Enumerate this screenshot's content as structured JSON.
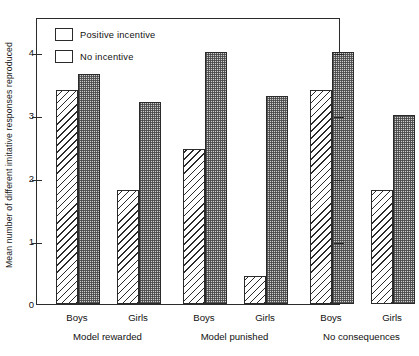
{
  "chart_data": {
    "type": "bar",
    "title": "",
    "xlabel": "",
    "ylabel": "Mean number of different imitative responses reproduced",
    "ylim": [
      0,
      4.55
    ],
    "yticks": [
      "0",
      "1",
      "2",
      "3",
      "4"
    ],
    "ytick_values": [
      0,
      1,
      2,
      3,
      4
    ],
    "grid": false,
    "legend_position": "top-left",
    "categories": [
      "Boys",
      "Girls",
      "Boys",
      "Girls",
      "Boys",
      "Girls"
    ],
    "groups": [
      {
        "group_label": "Model rewarded",
        "bars": [
          {
            "sex": "Boys",
            "no_incentive": 3.4,
            "positive_incentive": 3.65
          },
          {
            "sex": "Girls",
            "no_incentive": 1.8,
            "positive_incentive": 3.2
          }
        ]
      },
      {
        "group_label": "Model punished",
        "bars": [
          {
            "sex": "Boys",
            "no_incentive": 2.45,
            "positive_incentive": 4.0
          },
          {
            "sex": "Girls",
            "no_incentive": 0.45,
            "positive_incentive": 3.3
          }
        ]
      },
      {
        "group_label": "No consequences",
        "bars": [
          {
            "sex": "Boys",
            "no_incentive": 3.4,
            "positive_incentive": 4.0
          },
          {
            "sex": "Girls",
            "no_incentive": 1.8,
            "positive_incentive": 3.0
          }
        ]
      }
    ],
    "series": [
      {
        "name": "No incentive",
        "fill": "diagonal-hatch",
        "values": [
          3.4,
          1.8,
          2.45,
          0.45,
          3.4,
          1.8
        ]
      },
      {
        "name": "Positive incentive",
        "fill": "stipple-dots",
        "values": [
          3.65,
          3.2,
          4.0,
          3.3,
          4.0,
          3.0
        ]
      }
    ]
  },
  "legend": {
    "items": [
      {
        "label": "Positive incentive",
        "fill": "stipple-dots"
      },
      {
        "label": "No incentive",
        "fill": "diagonal-hatch"
      }
    ]
  },
  "axis": {
    "y_title": "Mean number of different imitative responses reproduced",
    "y_tick_labels": [
      "4",
      "3",
      "2",
      "1",
      "0"
    ]
  },
  "x_axis": {
    "sex_labels": [
      "Boys",
      "Girls",
      "Boys",
      "Girls",
      "Boys",
      "Girls"
    ],
    "group_labels": [
      "Model rewarded",
      "Model punished",
      "No consequences"
    ]
  },
  "colors": {
    "line": "#2b2b2b",
    "dots_fill": "#cfcfcf",
    "background": "#ffffff"
  }
}
